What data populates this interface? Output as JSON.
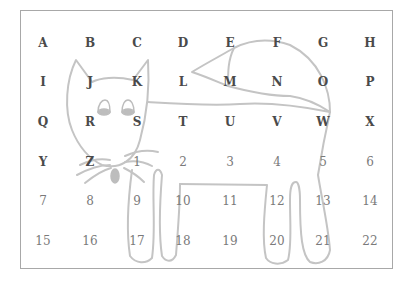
{
  "grid": {
    "columns_x": [
      43,
      90,
      137,
      183,
      230,
      277,
      323,
      370
    ],
    "rows_y": [
      43,
      82,
      122,
      162,
      201,
      241
    ],
    "cells": [
      [
        "A",
        "B",
        "C",
        "D",
        "E",
        "F",
        "G",
        "H"
      ],
      [
        "I",
        "J",
        "K",
        "L",
        "M",
        "N",
        "O",
        "P"
      ],
      [
        "Q",
        "R",
        "S",
        "T",
        "U",
        "V",
        "W",
        "X"
      ],
      [
        "Y",
        "Z",
        "1",
        "2",
        "3",
        "4",
        "5",
        "6"
      ],
      [
        "7",
        "8",
        "9",
        "10",
        "11",
        "12",
        "13",
        "14"
      ],
      [
        "15",
        "16",
        "17",
        "18",
        "19",
        "20",
        "21",
        "22"
      ]
    ]
  },
  "colors": {
    "letter": "#4a4a4a",
    "number": "#7a7a7a",
    "outline": "#c4c4c4",
    "fill": "#bdbdbd",
    "border": "#a8a8a8"
  },
  "illustration": "cat-outline"
}
